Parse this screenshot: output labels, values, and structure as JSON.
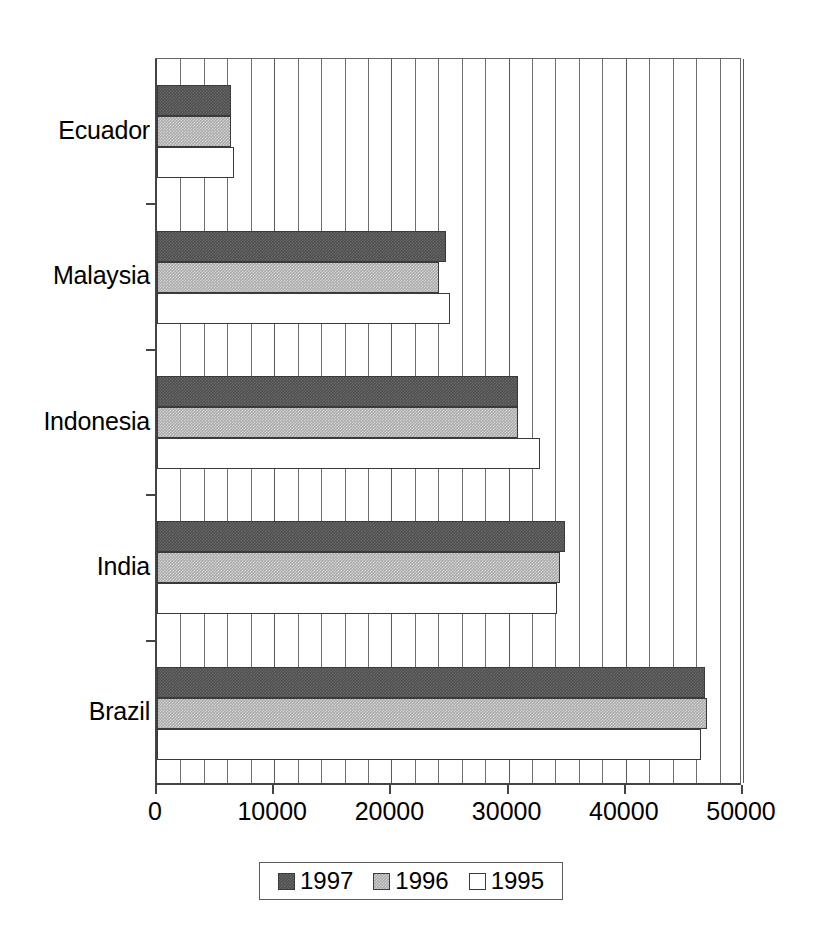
{
  "chart_data": {
    "type": "bar",
    "orientation": "horizontal",
    "title": "",
    "subtitle": "",
    "xlabel": "",
    "ylabel": "",
    "categories": [
      "Ecuador",
      "Malaysia",
      "Indonesia",
      "India",
      "Brazil"
    ],
    "series": [
      {
        "name": "1997",
        "color": "#4f4f4f",
        "values": [
          6300,
          24650,
          30800,
          34800,
          46750
        ]
      },
      {
        "name": "1996",
        "color": "#ababab",
        "values": [
          6300,
          24050,
          30800,
          34400,
          46900
        ]
      },
      {
        "name": "1995",
        "color": "#ffffff",
        "values": [
          6570,
          25000,
          32680,
          34100,
          46400
        ]
      }
    ],
    "xlim": [
      0,
      50000
    ],
    "xticks": [
      0,
      10000,
      20000,
      30000,
      40000,
      50000
    ],
    "xtick_labels": [
      "0",
      "10000",
      "20000",
      "30000",
      "40000",
      "50000"
    ],
    "minor_gridline_step": 2000,
    "grid": true,
    "grid_axis": "x",
    "legend": {
      "position": "bottom",
      "entries": [
        {
          "label": "1997",
          "swatch": "dark-gray-hatch"
        },
        {
          "label": "1996",
          "swatch": "medium-gray-hatch"
        },
        {
          "label": "1995",
          "swatch": "white"
        }
      ]
    }
  }
}
